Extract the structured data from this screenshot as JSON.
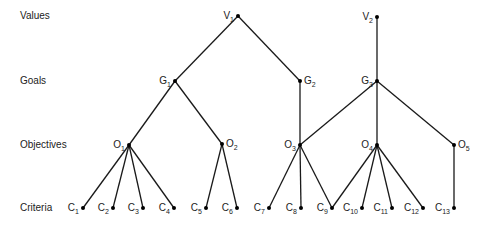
{
  "diagram": {
    "type": "hierarchy",
    "levels": [
      {
        "id": "values",
        "label": "Values"
      },
      {
        "id": "goals",
        "label": "Goals"
      },
      {
        "id": "objectives",
        "label": "Objectives"
      },
      {
        "id": "criteria",
        "label": "Criteria"
      }
    ],
    "nodes": [
      {
        "id": "V1",
        "base": "V",
        "sub": "1",
        "level": "values"
      },
      {
        "id": "V2",
        "base": "V",
        "sub": "2",
        "level": "values"
      },
      {
        "id": "G1",
        "base": "G",
        "sub": "1",
        "level": "goals"
      },
      {
        "id": "G2",
        "base": "G",
        "sub": "2",
        "level": "goals"
      },
      {
        "id": "G3",
        "base": "G",
        "sub": "3",
        "level": "goals"
      },
      {
        "id": "O1",
        "base": "O",
        "sub": "1",
        "level": "objectives"
      },
      {
        "id": "O2",
        "base": "O",
        "sub": "2",
        "level": "objectives"
      },
      {
        "id": "O3",
        "base": "O",
        "sub": "3",
        "level": "objectives"
      },
      {
        "id": "O4",
        "base": "O",
        "sub": "4",
        "level": "objectives"
      },
      {
        "id": "O5",
        "base": "O",
        "sub": "5",
        "level": "objectives"
      },
      {
        "id": "C1",
        "base": "C",
        "sub": "1",
        "level": "criteria"
      },
      {
        "id": "C2",
        "base": "C",
        "sub": "2",
        "level": "criteria"
      },
      {
        "id": "C3",
        "base": "C",
        "sub": "3",
        "level": "criteria"
      },
      {
        "id": "C4",
        "base": "C",
        "sub": "4",
        "level": "criteria"
      },
      {
        "id": "C5",
        "base": "C",
        "sub": "5",
        "level": "criteria"
      },
      {
        "id": "C6",
        "base": "C",
        "sub": "6",
        "level": "criteria"
      },
      {
        "id": "C7",
        "base": "C",
        "sub": "7",
        "level": "criteria"
      },
      {
        "id": "C8",
        "base": "C",
        "sub": "8",
        "level": "criteria"
      },
      {
        "id": "C9",
        "base": "C",
        "sub": "9",
        "level": "criteria"
      },
      {
        "id": "C10",
        "base": "C",
        "sub": "10",
        "level": "criteria"
      },
      {
        "id": "C11",
        "base": "C",
        "sub": "11",
        "level": "criteria"
      },
      {
        "id": "C12",
        "base": "C",
        "sub": "12",
        "level": "criteria"
      },
      {
        "id": "C13",
        "base": "C",
        "sub": "13",
        "level": "criteria"
      }
    ],
    "edges": [
      [
        "V1",
        "G1"
      ],
      [
        "V1",
        "G2"
      ],
      [
        "V2",
        "G3"
      ],
      [
        "G1",
        "O1"
      ],
      [
        "G1",
        "O2"
      ],
      [
        "G2",
        "O3"
      ],
      [
        "G3",
        "O3"
      ],
      [
        "G3",
        "O4"
      ],
      [
        "G3",
        "O5"
      ],
      [
        "O1",
        "C1"
      ],
      [
        "O1",
        "C2"
      ],
      [
        "O1",
        "C3"
      ],
      [
        "O1",
        "C4"
      ],
      [
        "O2",
        "C5"
      ],
      [
        "O2",
        "C6"
      ],
      [
        "O3",
        "C7"
      ],
      [
        "O3",
        "C8"
      ],
      [
        "O3",
        "C9"
      ],
      [
        "O4",
        "C9"
      ],
      [
        "O4",
        "C10"
      ],
      [
        "O4",
        "C11"
      ],
      [
        "O4",
        "C12"
      ],
      [
        "O5",
        "C13"
      ]
    ]
  }
}
